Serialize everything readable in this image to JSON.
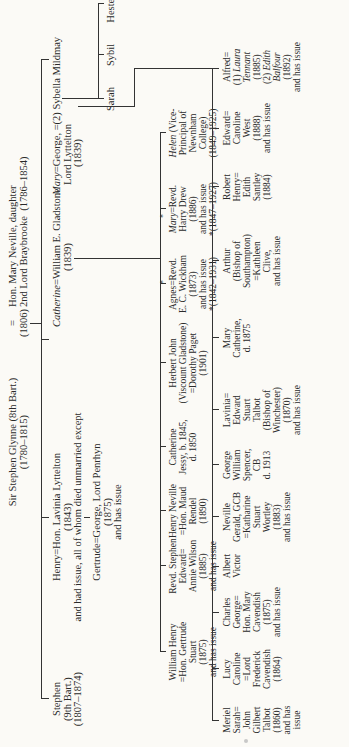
{
  "root": {
    "husband": "Sir Stephen Glynne (8th Bart.)",
    "husband_dates": "(1780–1815)",
    "marriage_sign": "=",
    "marriage_year": "(1806)",
    "wife": "Hon. Mary Neville, daughter",
    "wife_line2": "2nd  Lord  Braybrooke",
    "wife_dates": "(1786–1854)"
  },
  "children": [
    {
      "lines": [
        "Stephen",
        "(9th Bart.)",
        "(1807–1874)"
      ]
    },
    {
      "lines": [
        "Henry=Hon. Lavinia Lyttelton",
        "(1843)",
        "and had issue, all of whom died unmarried except"
      ],
      "sub": {
        "lines": [
          "Gertrude=George, Lord Penrhyn",
          "(1875)",
          "and has issue"
        ]
      }
    },
    {
      "italic": "Catherine",
      "lines": [
        "=William E. Gladstone",
        "(1839)"
      ]
    },
    {
      "italic": "Mary",
      "lines": [
        "=George, =(2) Sybella Mildmay",
        "Lord Lyttelton",
        "(1839)"
      ]
    }
  ],
  "lyttelton_second": [
    {
      "name": "Sarah"
    },
    {
      "name": "Sybil"
    },
    {
      "name": "Hester"
    }
  ],
  "gladstone_children": [
    {
      "lines": [
        "William Henry",
        "=Hon. Gertrude",
        "Stuart",
        "(1875)",
        "and has issue"
      ]
    },
    {
      "lines": [
        "Revd. Stephen",
        "Edward=",
        "Annie Wilson",
        "(1885)",
        "and has issue"
      ]
    },
    {
      "lines": [
        "Henry Neville",
        "=Hon. Maud",
        "Rendel",
        "(1890)"
      ]
    },
    {
      "lines": [
        "Catherine",
        "Jessy, b. 1845,",
        "d. 1850"
      ]
    },
    {
      "lines": [
        "Herbert John",
        "(Viscount Gladstone)",
        "=Dorothy Paget",
        "(1901)"
      ]
    },
    {
      "lines": [
        "*",
        "Agnes=Revd.",
        "E. C. Wickham",
        "(1873)",
        "and has issue",
        "*(1842–1931)"
      ]
    },
    {
      "lines": [
        "*",
        "Mary=Revd.",
        "Harry Drew",
        "(1886)",
        "and has issue",
        "*(1847–1927)"
      ]
    },
    {
      "lines": [
        "Helen (Vice-",
        "Principal of",
        "Newnham",
        "College)",
        "(1849–1925)"
      ]
    }
  ],
  "lyttelton_children": [
    {
      "lines": [
        "Meriel",
        "Sarah=",
        "John",
        "Gilbert",
        "Talbot",
        "(1860)",
        "and has",
        "issue"
      ]
    },
    {
      "lines": [
        "Lucy",
        "Caroline",
        "=Lord",
        "Frederick",
        "Cavendish",
        "(1864)"
      ]
    },
    {
      "lines": [
        "Charles",
        "George=",
        "Hon. Mary",
        "Cavendish",
        "(1875)",
        "and has issue"
      ]
    },
    {
      "lines": [
        "Albert",
        "Victor"
      ]
    },
    {
      "lines": [
        "Neville",
        "Gerald, GCB",
        "=Katharine",
        "Stuart",
        "Wortley",
        "(1883)",
        "and has issue"
      ]
    },
    {
      "lines": [
        "George",
        "William",
        "Spencer,",
        "CB",
        "d. 1913"
      ]
    },
    {
      "lines": [
        "Lavinia=",
        "Edward",
        "Stuart",
        "Talbot",
        "(Bishop of",
        "Winchester)",
        "(1870)",
        "and has issue"
      ]
    },
    {
      "lines": [
        "Mary",
        "Catherine,",
        "d. 1875"
      ]
    },
    {
      "lines": [
        "Arthur",
        "(Bishop of",
        "Southampton)",
        "=Kathleen",
        "Clive,",
        "and has issue"
      ]
    },
    {
      "lines": [
        "Robert",
        "Henry=",
        "Edith",
        "Santley",
        "(1884)"
      ]
    },
    {
      "lines": [
        "Edward=",
        "Caroline",
        "West",
        "(1888)",
        "and has issue"
      ]
    },
    {
      "lines": [
        "Alfred=",
        "(1) Laura",
        "Tennant",
        "(1885)",
        "(2) Edith",
        "Balfour",
        "(1892)",
        "and has issue"
      ]
    }
  ]
}
